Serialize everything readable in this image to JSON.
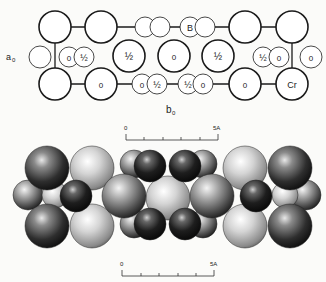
{
  "top_diagram": {
    "axis_label_a": "a",
    "axis_label_a_sub": "0",
    "axis_label_b": "b",
    "axis_label_b_sub": "0",
    "atom_labels": {
      "zero": "0",
      "half": "½",
      "boron": "B",
      "chromium": "Cr"
    },
    "scale_bar": {
      "start": "0",
      "end": "5A"
    }
  },
  "bottom_diagram": {
    "title": "space-filling model",
    "scale_bar": {
      "start": "0",
      "end": "5A"
    }
  },
  "colors": {
    "line": "#1a1a1a",
    "background": "#fbfbf9",
    "sphere_dark": "#2a2a2a",
    "sphere_light": "#d8d8d8"
  }
}
